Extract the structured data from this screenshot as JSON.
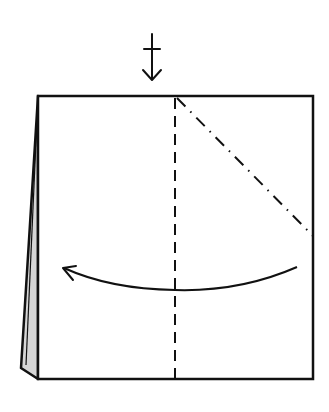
{
  "diagram": {
    "type": "origami-fold-step",
    "background": "#ffffff",
    "stroke_color": "#111111",
    "flap_fill": "#d6d6d6",
    "symbols": {
      "push_arrow": {
        "name": "push-arrow-icon",
        "meaning": "turn over / push here",
        "x": 149,
        "y_top": 34,
        "y_bottom": 80
      },
      "valley_fold_line": {
        "name": "valley-fold-line",
        "style": "dashed",
        "x": 175,
        "y1": 96,
        "y2": 379
      },
      "mountain_fold_line": {
        "name": "mountain-fold-line",
        "style": "dash-dot",
        "x1": 177,
        "y1": 98,
        "x2": 313,
        "y2": 236
      },
      "fold_arrow": {
        "name": "curved-fold-arrow",
        "direction": "right-to-left",
        "start": [
          297,
          267
        ],
        "end": [
          63,
          268
        ]
      }
    },
    "paper": {
      "top_left": [
        38,
        96
      ],
      "top_right": [
        313,
        96
      ],
      "bottom_right": [
        313,
        379
      ],
      "bottom_left": [
        38,
        379
      ],
      "back_flap": [
        [
          38,
          96
        ],
        [
          20,
          370
        ],
        [
          38,
          379
        ]
      ]
    }
  }
}
